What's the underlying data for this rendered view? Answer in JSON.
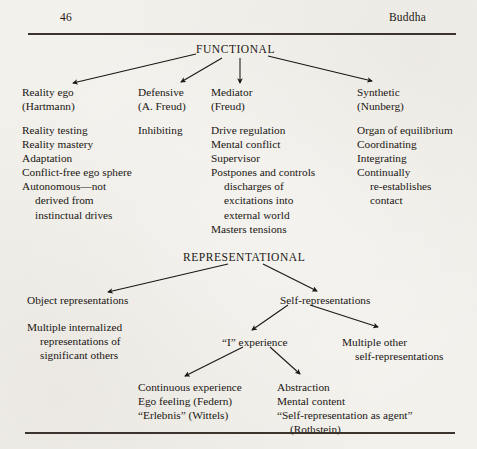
{
  "page": {
    "folio": "46",
    "running_head": "Buddha",
    "width": 477,
    "height": 449,
    "paper_color": "#f3f1ec",
    "ink_color": "#1a1713"
  },
  "rules": {
    "top": "horizontal-rule-top",
    "bottom": "horizontal-rule-bottom"
  },
  "diagram": {
    "type": "tree",
    "sections": [
      {
        "id": "functional",
        "root_label": "FUNCTIONAL",
        "children": [
          {
            "id": "reality-ego",
            "heading_lines": [
              "Reality ego",
              "(Hartmann)"
            ],
            "items": [
              "Reality testing",
              "Reality mastery",
              "Adaptation",
              "Conflict-free ego sphere",
              "Autonomous—not",
              "derived from",
              "instinctual drives"
            ]
          },
          {
            "id": "defensive",
            "heading_lines": [
              "Defensive",
              "(A. Freud)"
            ],
            "items": [
              "Inhibiting"
            ]
          },
          {
            "id": "mediator",
            "heading_lines": [
              "Mediator",
              "(Freud)"
            ],
            "items": [
              "Drive regulation",
              "Mental conflict",
              "Supervisor",
              "Postpones and controls",
              "discharges of",
              "excitations into",
              "external world",
              "Masters tensions"
            ]
          },
          {
            "id": "synthetic",
            "heading_lines": [
              "Synthetic",
              "(Nunberg)"
            ],
            "items": [
              "Organ of equilibrium",
              "Coordinating",
              "Integrating",
              "Continually",
              "re-establishes",
              "contact"
            ]
          }
        ]
      },
      {
        "id": "representational",
        "root_label": "REPRESENTATIONAL",
        "children": [
          {
            "id": "object-representations",
            "heading_lines": [
              "Object representations"
            ],
            "items": [
              "Multiple internalized",
              "representations of",
              "significant others"
            ]
          },
          {
            "id": "self-representations",
            "heading_lines": [
              "Self-representations"
            ],
            "children": [
              {
                "id": "i-experience",
                "heading_lines": [
                  "“I” experience"
                ],
                "children": [
                  {
                    "id": "continuous-experience",
                    "items": [
                      "Continuous experience",
                      "Ego feeling (Federn)",
                      "“Erlebnis” (Wittels)"
                    ]
                  },
                  {
                    "id": "abstraction",
                    "items": [
                      "Abstraction",
                      "Mental content",
                      "“Self-representation as agent”",
                      "(Rothstein)"
                    ]
                  }
                ]
              },
              {
                "id": "multiple-other",
                "items": [
                  "Multiple other",
                  "self-representations"
                ]
              }
            ]
          }
        ]
      }
    ]
  }
}
